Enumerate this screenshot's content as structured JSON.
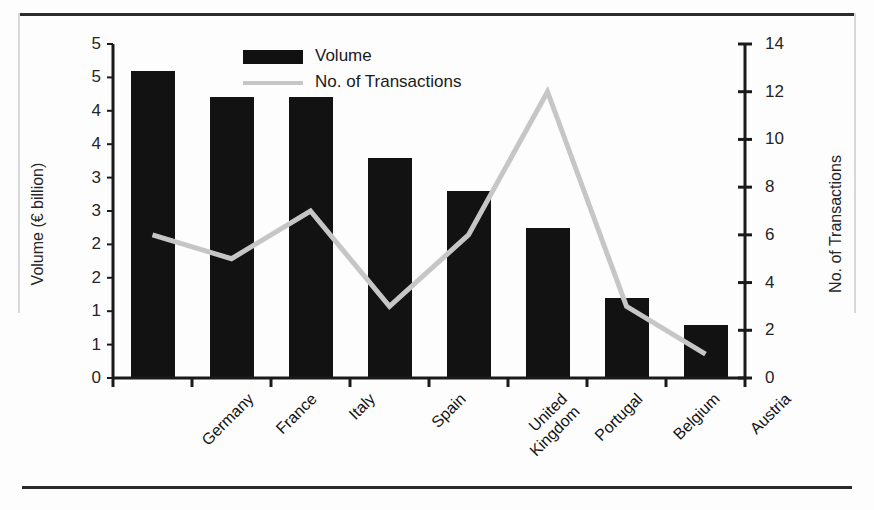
{
  "chart_data": {
    "type": "bar",
    "title": "",
    "categories": [
      "Germany",
      "France",
      "Italy",
      "Spain",
      "United Kingdom",
      "Portugal",
      "Belgium",
      "Austria"
    ],
    "series": [
      {
        "name": "Volume",
        "type": "bar",
        "axis": "left",
        "color": "#121212",
        "values": [
          4.6,
          4.2,
          4.2,
          3.3,
          2.8,
          2.25,
          1.2,
          0.8
        ]
      },
      {
        "name": "No. of Transactions",
        "type": "line",
        "axis": "right",
        "color": "#c6c6c6",
        "values": [
          6,
          5,
          7,
          3,
          6,
          12,
          3,
          1
        ]
      }
    ],
    "xlabel": "",
    "ylabel": "Volume (€ billion)",
    "y2label": "No. of Transactions",
    "ylim": [
      0,
      5
    ],
    "y2lim": [
      0,
      14
    ],
    "yticks": [
      "5",
      "5",
      "4",
      "4",
      "3",
      "3",
      "2",
      "2",
      "1",
      "1",
      "0"
    ],
    "y2ticks": [
      "14",
      "12",
      "10",
      "8",
      "6",
      "4",
      "2",
      "0"
    ],
    "grid": false,
    "legend_position": "top-center"
  },
  "axes": {
    "left_title": "Volume (€ billion)",
    "right_title": "No. of Transactions"
  },
  "legend": {
    "items": [
      {
        "label": "Volume",
        "marker": "bar-swatch"
      },
      {
        "label": "No. of Transactions",
        "marker": "line-swatch"
      }
    ]
  },
  "ticks": {
    "left": [
      "5",
      "5",
      "4",
      "4",
      "3",
      "3",
      "2",
      "2",
      "1",
      "1",
      "0"
    ],
    "right": [
      "14",
      "12",
      "10",
      "8",
      "6",
      "4",
      "2",
      "0"
    ]
  },
  "categories": [
    "Germany",
    "France",
    "Italy",
    "Spain",
    "United Kingdom",
    "Portugal",
    "Belgium",
    "Austria"
  ]
}
